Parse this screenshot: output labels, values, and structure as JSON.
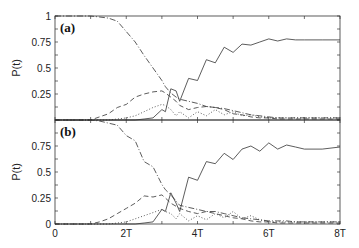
{
  "chart_data": [
    {
      "type": "line",
      "panel_label": "(a)",
      "ylabel": "P(t)",
      "xlabel": "",
      "ylim": [
        0,
        1
      ],
      "xlim": [
        0,
        8
      ],
      "x_unit": "T",
      "yticks": [
        "0.25",
        "0.5",
        "0.75",
        "1"
      ],
      "xticks": [],
      "grid": false,
      "x": [
        0,
        0.5,
        1,
        1.25,
        1.5,
        1.75,
        2,
        2.25,
        2.5,
        2.75,
        3,
        3.1,
        3.25,
        3.4,
        3.5,
        3.75,
        4,
        4.25,
        4.5,
        4.75,
        5,
        5.25,
        5.5,
        5.75,
        6,
        6.25,
        6.5,
        6.75,
        7,
        7.5,
        8
      ],
      "series": [
        {
          "name": "solid",
          "style": "solid",
          "values": [
            0,
            0,
            0,
            0,
            0,
            0,
            0,
            0,
            0.01,
            0.02,
            0.1,
            0.08,
            0.3,
            0.28,
            0.18,
            0.4,
            0.38,
            0.58,
            0.55,
            0.7,
            0.65,
            0.73,
            0.72,
            0.75,
            0.78,
            0.76,
            0.78,
            0.77,
            0.77,
            0.77,
            0.77
          ]
        },
        {
          "name": "dash-dot",
          "style": "dashdot",
          "values": [
            1,
            1,
            1,
            0.99,
            0.98,
            0.95,
            0.85,
            0.75,
            0.62,
            0.5,
            0.38,
            0.32,
            0.26,
            0.22,
            0.2,
            0.18,
            0.16,
            0.13,
            0.12,
            0.11,
            0.09,
            0.07,
            0.05,
            0.04,
            0.03,
            0.02,
            0.02,
            0.02,
            0.02,
            0.02,
            0.02
          ]
        },
        {
          "name": "dashed",
          "style": "dashed",
          "values": [
            0,
            0,
            0,
            0.03,
            0.06,
            0.12,
            0.15,
            0.22,
            0.25,
            0.27,
            0.28,
            0.26,
            0.22,
            0.18,
            0.14,
            0.1,
            0.12,
            0.13,
            0.12,
            0.1,
            0.06,
            0.05,
            0.03,
            0.02,
            0.02,
            0.01,
            0.01,
            0.01,
            0.01,
            0.01,
            0.01
          ]
        },
        {
          "name": "dotted",
          "style": "dotted",
          "values": [
            0,
            0,
            0,
            0,
            0,
            0.01,
            0.02,
            0.04,
            0.08,
            0.12,
            0.15,
            0.14,
            0.1,
            0.04,
            0.08,
            0.02,
            0.08,
            0.04,
            0.1,
            0.05,
            0.08,
            0.04,
            0.05,
            0.03,
            0.02,
            0.02,
            0.02,
            0.02,
            0.02,
            0.02,
            0.02
          ]
        }
      ]
    },
    {
      "type": "line",
      "panel_label": "(b)",
      "ylabel": "P(t)",
      "xlabel": "",
      "ylim": [
        0,
        1
      ],
      "xlim": [
        0,
        8
      ],
      "x_unit": "T",
      "yticks": [
        "0",
        "0.25",
        "0.5",
        "0.75"
      ],
      "xticks": [
        "0",
        "2T",
        "4T",
        "6T",
        "8T"
      ],
      "grid": false,
      "x": [
        0,
        0.5,
        1,
        1.25,
        1.5,
        1.75,
        2,
        2.25,
        2.5,
        2.75,
        3,
        3.1,
        3.25,
        3.4,
        3.5,
        3.75,
        4,
        4.25,
        4.5,
        4.75,
        5,
        5.25,
        5.5,
        5.75,
        6,
        6.25,
        6.5,
        6.75,
        7,
        7.5,
        8
      ],
      "series": [
        {
          "name": "solid",
          "style": "solid",
          "values": [
            0,
            0,
            0,
            0,
            0,
            0,
            0,
            0,
            0.01,
            0.02,
            0.14,
            0.12,
            0.3,
            0.2,
            0.12,
            0.45,
            0.42,
            0.6,
            0.58,
            0.68,
            0.62,
            0.72,
            0.75,
            0.7,
            0.78,
            0.72,
            0.76,
            0.74,
            0.72,
            0.72,
            0.74
          ]
        },
        {
          "name": "dash-dot",
          "style": "dashdot",
          "values": [
            1,
            1,
            1,
            0.99,
            0.97,
            0.95,
            0.85,
            0.8,
            0.6,
            0.55,
            0.38,
            0.33,
            0.28,
            0.22,
            0.18,
            0.16,
            0.14,
            0.12,
            0.12,
            0.1,
            0.08,
            0.06,
            0.05,
            0.04,
            0.03,
            0.03,
            0.03,
            0.02,
            0.02,
            0.02,
            0.02
          ]
        },
        {
          "name": "dashed",
          "style": "dashed",
          "values": [
            0,
            0,
            0,
            0.02,
            0.05,
            0.1,
            0.15,
            0.2,
            0.27,
            0.26,
            0.28,
            0.25,
            0.2,
            0.17,
            0.15,
            0.12,
            0.1,
            0.12,
            0.1,
            0.08,
            0.06,
            0.05,
            0.03,
            0.02,
            0.02,
            0.01,
            0.01,
            0.01,
            0.01,
            0.01,
            0.01
          ]
        },
        {
          "name": "dotted",
          "style": "dotted",
          "values": [
            0,
            0,
            0,
            0,
            0,
            0.01,
            0.02,
            0.05,
            0.08,
            0.11,
            0.14,
            0.12,
            0.1,
            0.05,
            0.1,
            0.03,
            0.08,
            0.04,
            0.1,
            0.06,
            0.12,
            0.05,
            0.08,
            0.04,
            0.02,
            0.02,
            0.02,
            0.02,
            0.02,
            0.02,
            0.02
          ]
        }
      ]
    }
  ]
}
